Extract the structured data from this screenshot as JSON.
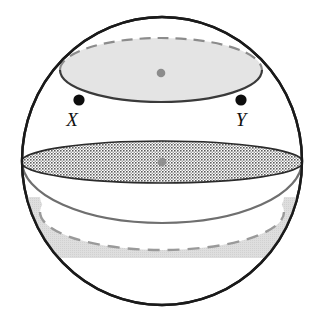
{
  "diagram": {
    "type": "solid-geometry-sphere",
    "background_color": "#ffffff",
    "sphere": {
      "name": "sphere-outline",
      "center": {
        "x": 162,
        "y": 161
      },
      "radius_x": 140,
      "radius_y": 144,
      "stroke_color": "#1a1a1a",
      "stroke_width": 2.4,
      "fill_color": "#ffffff"
    },
    "upper_cap": {
      "name": "upper-circular-cross-section",
      "description": "Tilted circle cutting the top of the sphere, shown as an ellipse with a solid front arc and dashed rear arc",
      "center": {
        "x": 161,
        "y": 70
      },
      "radius_x": 101,
      "radius_y": 32,
      "fill_color": "#e3e3e3",
      "fill_opacity": 0.95,
      "front_arc_color": "#3a3a3a",
      "front_arc_width": 2.2,
      "rear_arc_color": "#8c8c8c",
      "rear_arc_width": 2.2,
      "rear_arc_dash": "11 7"
    },
    "upper_cap_center_dot": {
      "name": "upper-cap-center-point",
      "x": 161,
      "y": 73,
      "radius": 4.3,
      "color": "#8c8c8c"
    },
    "equator_circle": {
      "name": "great-circle-through-x-and-y",
      "description": "Gray circle of the sphere passing through points X and Y; only the rear/lower arc is visible",
      "stroke_color": "#6f6f6f",
      "stroke_width": 2.2
    },
    "middle_disc": {
      "name": "middle-hatched-cross-section",
      "description": "Horizontal circular cross-section rendered as a crosshatched (checkerboard textured) ellipse",
      "center": {
        "x": 162,
        "y": 162
      },
      "radius_x": 140,
      "radius_y": 21,
      "outline_color": "#2b2b2b",
      "outline_width": 1.6,
      "texture": "crosshatch-checkerboard",
      "texture_color": "#5c5c5c",
      "texture_cell_px": 3
    },
    "middle_disc_center_dot": {
      "name": "middle-disc-center-point",
      "x": 162,
      "y": 162,
      "radius": 4.3,
      "color": "#8c8c8c"
    },
    "lower_band": {
      "name": "lower-shaded-band",
      "description": "Light gray stippled band in the bottom hemisphere bounded above by the sphere profile and below by a horizontal cut, with a dashed rear arc across it",
      "fill_color": "#d8d8d8",
      "fill_opacity": 0.85,
      "top_y": 197,
      "bottom_y": 258,
      "dashed_arc": {
        "name": "lower-band-rear-arc",
        "center": {
          "x": 162,
          "y": 212
        },
        "radius_x": 122,
        "radius_y": 38,
        "stroke_color": "#9a9a9a",
        "stroke_width": 2.4,
        "dash": "12 8"
      }
    },
    "points": [
      {
        "name": "point-x",
        "label": "X",
        "dot": {
          "x": 79,
          "y": 100,
          "radius": 5.6,
          "color": "#0d0d0d"
        },
        "label_position": {
          "x": 72,
          "y": 125
        }
      },
      {
        "name": "point-y",
        "label": "Y",
        "dot": {
          "x": 241,
          "y": 100,
          "radius": 5.6,
          "color": "#0d0d0d"
        },
        "label_position": {
          "x": 234,
          "y": 125
        }
      }
    ]
  }
}
